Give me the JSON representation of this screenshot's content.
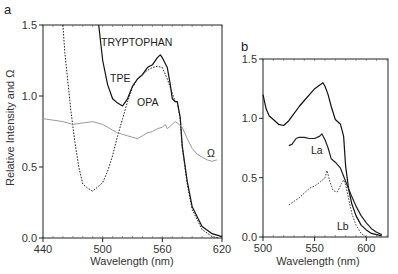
{
  "chart_data": [
    {
      "panel": "a",
      "type": "line",
      "xlabel": "Wavelength (nm)",
      "ylabel": "Relative Intensity and Ω",
      "xlim": [
        440,
        620
      ],
      "ylim": [
        0.0,
        1.5
      ],
      "xticks": [
        "440",
        "500",
        "560",
        "620"
      ],
      "yticks": [
        "0.0",
        "0.5",
        "1.0",
        "1.5"
      ],
      "grid": false,
      "series": [
        {
          "name": "TRYPTOPHAN / TPE",
          "style": "solid",
          "color": "#111111",
          "x": [
            496,
            500,
            505,
            510,
            515,
            520,
            525,
            530,
            535,
            540,
            545,
            550,
            555,
            558,
            560,
            565,
            568,
            570,
            573,
            575,
            578,
            580,
            585,
            590,
            600,
            610,
            620
          ],
          "y": [
            1.5,
            1.25,
            1.08,
            0.98,
            0.95,
            0.93,
            0.98,
            1.07,
            1.12,
            1.15,
            1.2,
            1.22,
            1.27,
            1.29,
            1.27,
            1.2,
            1.08,
            0.98,
            0.96,
            0.96,
            0.85,
            0.65,
            0.4,
            0.22,
            0.08,
            0.03,
            0.01
          ]
        },
        {
          "name": "OPA",
          "style": "dotted",
          "color": "#222222",
          "x": [
            460,
            462,
            465,
            468,
            472,
            476,
            480,
            485,
            490,
            495,
            500,
            505,
            510,
            515,
            520,
            525,
            530,
            535,
            540,
            545,
            550,
            555,
            560,
            565,
            570,
            573,
            575,
            578,
            580,
            585,
            590,
            600,
            610,
            617
          ],
          "y": [
            1.5,
            1.3,
            1.1,
            0.9,
            0.68,
            0.5,
            0.38,
            0.35,
            0.33,
            0.36,
            0.39,
            0.47,
            0.58,
            0.72,
            0.84,
            0.96,
            1.06,
            1.12,
            1.15,
            1.18,
            1.2,
            1.21,
            1.2,
            1.12,
            1.02,
            0.96,
            0.95,
            0.84,
            0.64,
            0.38,
            0.2,
            0.06,
            0.01,
            0.0
          ]
        },
        {
          "name": "Ω",
          "style": "solid-gray",
          "color": "#9a9a9a",
          "x": [
            440,
            450,
            460,
            470,
            480,
            490,
            500,
            505,
            510,
            515,
            520,
            525,
            530,
            535,
            540,
            545,
            550,
            555,
            560,
            563,
            565,
            570,
            573,
            575,
            580,
            585,
            590,
            595,
            600,
            605,
            610,
            615
          ],
          "y": [
            0.84,
            0.83,
            0.82,
            0.8,
            0.81,
            0.82,
            0.8,
            0.78,
            0.76,
            0.74,
            0.73,
            0.72,
            0.71,
            0.7,
            0.72,
            0.74,
            0.75,
            0.77,
            0.78,
            0.8,
            0.77,
            0.8,
            0.82,
            0.81,
            0.78,
            0.7,
            0.63,
            0.59,
            0.57,
            0.55,
            0.54,
            0.55
          ]
        }
      ],
      "annotations": [
        "TRYPTOPHAN",
        "TPE",
        "OPA",
        "Ω"
      ]
    },
    {
      "panel": "b",
      "type": "line",
      "xlabel": "Wavelength (nm)",
      "ylabel": "",
      "xlim": [
        500,
        621
      ],
      "ylim": [
        0.0,
        1.5
      ],
      "xticks": [
        "500",
        "550",
        "600"
      ],
      "yticks": [
        "0.0",
        "0.5",
        "1.0",
        "1.5"
      ],
      "grid": false,
      "series": [
        {
          "name": "Total",
          "style": "solid",
          "color": "#111111",
          "x": [
            500,
            503,
            506,
            510,
            515,
            520,
            525,
            530,
            535,
            540,
            545,
            550,
            555,
            558,
            560,
            563,
            566,
            570,
            575,
            578,
            580,
            583,
            586,
            590,
            595,
            600,
            605,
            610,
            615
          ],
          "y": [
            1.2,
            1.08,
            1.02,
            0.99,
            0.95,
            0.94,
            0.98,
            1.04,
            1.1,
            1.15,
            1.2,
            1.25,
            1.28,
            1.3,
            1.27,
            1.2,
            1.1,
            0.99,
            0.95,
            0.85,
            0.6,
            0.4,
            0.28,
            0.18,
            0.1,
            0.06,
            0.03,
            0.02,
            0.01
          ]
        },
        {
          "name": "La",
          "style": "solid",
          "color": "#222222",
          "x": [
            525,
            528,
            532,
            535,
            540,
            545,
            550,
            555,
            557,
            560,
            563,
            566,
            570,
            575,
            580,
            585,
            590,
            595,
            600,
            605,
            610,
            615
          ],
          "y": [
            0.77,
            0.78,
            0.83,
            0.84,
            0.84,
            0.83,
            0.83,
            0.85,
            0.87,
            0.82,
            0.75,
            0.66,
            0.63,
            0.58,
            0.47,
            0.36,
            0.26,
            0.18,
            0.12,
            0.07,
            0.04,
            0.02
          ]
        },
        {
          "name": "Lb",
          "style": "dotted",
          "color": "#444444",
          "x": [
            525,
            530,
            535,
            540,
            545,
            550,
            555,
            560,
            562,
            565,
            568,
            572,
            576,
            578,
            580,
            583,
            586,
            590,
            595,
            600
          ],
          "y": [
            0.27,
            0.3,
            0.33,
            0.37,
            0.41,
            0.43,
            0.46,
            0.5,
            0.56,
            0.46,
            0.39,
            0.38,
            0.45,
            0.48,
            0.44,
            0.32,
            0.2,
            0.1,
            0.03,
            0.0
          ]
        }
      ],
      "annotations": [
        "La",
        "Lb"
      ]
    }
  ],
  "panels": {
    "a": {
      "label": "a",
      "xlabel": "Wavelength (nm)",
      "ylabel": "Relative Intensity and Ω",
      "xticks": [
        "440",
        "500",
        "560",
        "620"
      ],
      "yticks": [
        "0.0",
        "0.5",
        "1.0",
        "1.5"
      ],
      "annotations": {
        "tryptophan": "TRYPTOPHAN",
        "tpe": "TPE",
        "opa": "OPA",
        "omega": "Ω"
      }
    },
    "b": {
      "label": "b",
      "xlabel": "Wavelength (nm)",
      "xticks": [
        "500",
        "550",
        "600"
      ],
      "yticks": [
        "0.0",
        "0.5",
        "1.0",
        "1.5"
      ],
      "annotations": {
        "la": "La",
        "lb": "Lb"
      }
    }
  }
}
